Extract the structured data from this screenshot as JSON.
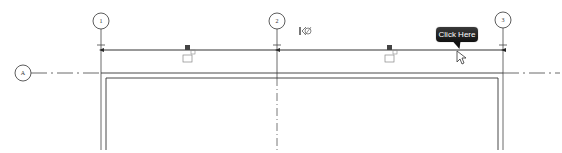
{
  "grid": {
    "vertical_bubbles": [
      {
        "label": "1",
        "x": 101
      },
      {
        "label": "2",
        "x": 277
      },
      {
        "label": "3",
        "x": 503
      }
    ],
    "horizontal_bubbles": [
      {
        "label": "A",
        "y": 73
      }
    ]
  },
  "tooltip": {
    "label": "Click Here"
  },
  "icons": {
    "hide_in_view": "hide-element-icon",
    "constraint_lock": "lock-icon",
    "cursor": "arrow-cursor"
  },
  "colors": {
    "line": "#333333",
    "grid_line": "#444444",
    "tooltip_bg": "#1a1a1a",
    "tooltip_text": "#ffffff"
  }
}
